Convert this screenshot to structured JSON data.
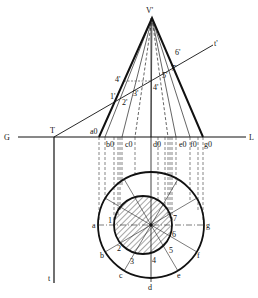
{
  "diagram": {
    "title_hidden": "Cone cut by inclined plane — front view and plan",
    "apex_label": "V'",
    "ground_line": {
      "left_label": "G",
      "right_label": "L"
    },
    "trace_point_label": "T",
    "plane_vertical_trace_label": "t'",
    "plane_horizontal_trace_label": "t",
    "front_view_labels": [
      "1'",
      "2'",
      "3'",
      "4'",
      "4'",
      "5'",
      "6'",
      "7'"
    ],
    "base_labels": [
      "a0",
      "b0",
      "c0",
      "d0",
      "e0",
      "f0",
      "g0"
    ],
    "plan_outer_labels": [
      "a",
      "b",
      "c",
      "d",
      "e",
      "f",
      "g"
    ],
    "plan_inner_labels": [
      "1",
      "2",
      "3",
      "4",
      "5",
      "6",
      "7"
    ],
    "colors": {
      "line": "#111111",
      "background": "#ffffff"
    }
  }
}
